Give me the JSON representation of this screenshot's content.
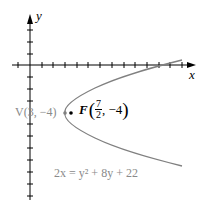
{
  "axes": {
    "x_label": "x",
    "y_label": "y"
  },
  "vertex": {
    "label": "V(3, −4)",
    "x": 3,
    "y": -4
  },
  "focus": {
    "label_prefix": "F",
    "x_num": "7",
    "x_den": "2",
    "y_label": ", −4",
    "x": 3.5,
    "y": -4
  },
  "equation": "2x = y² + 8y + 22",
  "colors": {
    "axis": "#000000",
    "curve": "#808080",
    "label_gray": "#8a8a8a"
  }
}
